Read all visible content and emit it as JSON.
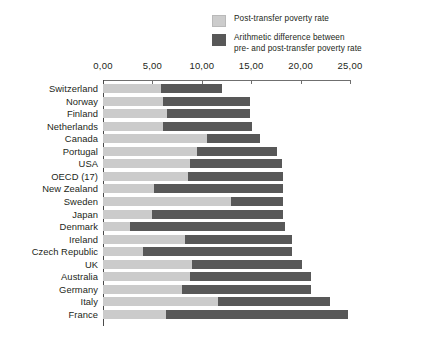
{
  "legend": {
    "items": [
      {
        "swatch": "light",
        "label": "Post-transfer poverty rate"
      },
      {
        "swatch": "dark",
        "label": "Arithmetic difference between\npre- and post-transfer poverty rate"
      }
    ]
  },
  "axis": {
    "tick_labels": [
      "0,00",
      "5,00",
      "10,00",
      "15,00",
      "20,00",
      "25,00"
    ],
    "tick_values": [
      0,
      5,
      10,
      15,
      20,
      25
    ]
  },
  "colors": {
    "post_transfer": "#cbcbcb",
    "difference": "#585858",
    "axis": "#6f6f6f",
    "text": "#231f20",
    "background": "#ffffff"
  },
  "chart_data": {
    "type": "bar",
    "orientation": "horizontal",
    "stacked": true,
    "title": "",
    "subtitle": "",
    "xlabel": "",
    "ylabel": "",
    "xlim": [
      0,
      25
    ],
    "grid": false,
    "legend_position": "top-right",
    "categories": [
      "Switzerland",
      "Norway",
      "Finland",
      "Netherlands",
      "Canada",
      "Portugal",
      "USA",
      "OECD (17)",
      "New Zealand",
      "Sweden",
      "Japan",
      "Denmark",
      "Ireland",
      "Czech Republic",
      "UK",
      "Australia",
      "Germany",
      "Italy",
      "France"
    ],
    "series": [
      {
        "name": "Post-transfer poverty rate",
        "color": "#cbcbcb",
        "values": [
          5.9,
          6.1,
          6.5,
          6.1,
          10.5,
          9.5,
          8.8,
          8.6,
          5.2,
          13.0,
          5.0,
          2.7,
          8.3,
          4.0,
          9.0,
          8.8,
          8.0,
          11.6,
          6.4
        ]
      },
      {
        "name": "Arithmetic difference between pre- and post-transfer poverty rate",
        "color": "#585858",
        "values": [
          6.1,
          8.8,
          8.4,
          9.0,
          5.4,
          8.1,
          9.3,
          9.6,
          13.0,
          5.2,
          13.2,
          15.7,
          10.8,
          15.1,
          11.1,
          12.3,
          13.1,
          11.4,
          18.4
        ]
      }
    ],
    "totals": [
      12.0,
      14.9,
      14.9,
      15.1,
      15.9,
      17.6,
      18.1,
      18.2,
      18.2,
      18.2,
      18.2,
      18.4,
      19.1,
      19.1,
      20.1,
      21.1,
      21.1,
      23.0,
      24.8
    ]
  }
}
